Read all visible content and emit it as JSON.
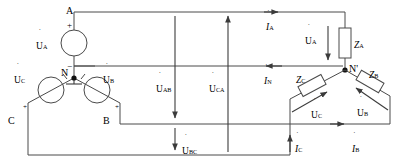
{
  "diagram": {
    "type": "electrical-schematic",
    "colors": {
      "wire": "#4a4a4a",
      "text": "#2b2b2b",
      "node": "#111111",
      "background": "#ffffff"
    },
    "source": {
      "name": "Y-connected three-phase source",
      "neutral_label": "N",
      "terminals": [
        {
          "id": "A",
          "label": "A"
        },
        {
          "id": "B",
          "label": "B"
        },
        {
          "id": "C",
          "label": "C"
        }
      ],
      "phases": [
        {
          "id": "a",
          "label": "U",
          "subscript": "A",
          "plus": "+",
          "minus": "−"
        },
        {
          "id": "b",
          "label": "U",
          "subscript": "B",
          "plus": "+"
        },
        {
          "id": "c",
          "label": "U",
          "subscript": "C",
          "plus": "+"
        }
      ]
    },
    "load": {
      "name": "Y-connected three-phase load",
      "neutral_label": "N'",
      "impedances": [
        {
          "id": "za",
          "label": "Z",
          "subscript": "A"
        },
        {
          "id": "zb",
          "label": "Z",
          "subscript": "B"
        },
        {
          "id": "zc",
          "label": "Z",
          "subscript": "C"
        }
      ],
      "phase_voltages": [
        {
          "id": "ua_load",
          "label": "U",
          "subscript": "A"
        },
        {
          "id": "ub_load",
          "label": "U",
          "subscript": "B"
        },
        {
          "id": "uc_load",
          "label": "U",
          "subscript": "C"
        }
      ]
    },
    "line_voltages": [
      {
        "id": "uab",
        "label": "U",
        "subscript": "AB"
      },
      {
        "id": "uca",
        "label": "U",
        "subscript": "CA"
      },
      {
        "id": "ubc",
        "label": "U",
        "subscript": "BC"
      }
    ],
    "currents": [
      {
        "id": "ia",
        "label": "I",
        "subscript": "A"
      },
      {
        "id": "in",
        "label": "I",
        "subscript": "N"
      },
      {
        "id": "ib",
        "label": "I",
        "subscript": "B"
      },
      {
        "id": "ic",
        "label": "I",
        "subscript": "C"
      }
    ]
  }
}
